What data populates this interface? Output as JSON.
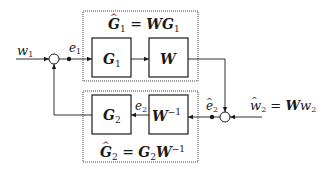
{
  "diagram": {
    "top_group": {
      "title_hat": "G",
      "title_sub": "1",
      "title_rest": " = ",
      "title_w": "W",
      "title_g": "G",
      "title_g_sub": "1"
    },
    "bottom_group": {
      "title_hat": "G",
      "title_sub": "2",
      "title_rest": " = ",
      "title_g": "G",
      "title_g_sub": "2",
      "title_w": "W",
      "title_w_sup": "−1"
    },
    "blocks": {
      "g1": {
        "main": "G",
        "sub": "1"
      },
      "w": {
        "main": "W"
      },
      "g2": {
        "main": "G",
        "sub": "2"
      },
      "winv": {
        "main": "W",
        "sup": "−1"
      }
    },
    "signals": {
      "w1": {
        "main": "w",
        "sub": "1"
      },
      "e1": {
        "main": "e",
        "sub": "1"
      },
      "e2": {
        "main": "e",
        "sub": "2"
      },
      "e2hat": {
        "main": "e",
        "sub": "2"
      },
      "w2hat": {
        "main": "w",
        "sub": "2",
        "eq": " = ",
        "w": "W",
        "w2": "w",
        "w2_sub": "2"
      }
    }
  }
}
